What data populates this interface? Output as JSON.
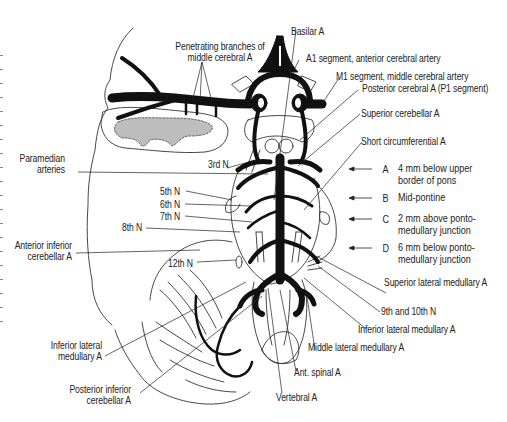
{
  "figure": {
    "colors": {
      "ink": "#111111",
      "line": "#333333",
      "gray_matter": "#bdbdbd",
      "background": "#ffffff"
    }
  },
  "labels": {
    "penetrating_branches": [
      "Penetrating branches of",
      "middle cerebral A"
    ],
    "basilar": "Basilar A",
    "a1_segment": "A1 segment, anterior cerebral artery",
    "m1_segment": "M1 segment, middle cerebral artery",
    "posterior_cerebral": "Posterior cerebral A (P1 segment)",
    "superior_cerebellar": "Superior cerebellar A",
    "short_circumferential": "Short circumferential A",
    "paramedian": [
      "Paramedian",
      "arteries"
    ],
    "third_n": "3rd N",
    "fifth_n": "5th N",
    "sixth_n": "6th N",
    "seventh_n": "7th N",
    "eighth_n": "8th N",
    "aica": [
      "Anterior inferior",
      "cerebellar A"
    ],
    "twelfth_n": "12th N",
    "superior_lateral_medullary": "Superior lateral medullary A",
    "ninth_tenth_n": "9th and 10th N",
    "inferior_lateral_medullary_right": "Inferior lateral medullary A",
    "middle_lateral_medullary": "Middle lateral medullary A",
    "ant_spinal": "Ant. spinal A",
    "vertebral": "Vertebral A",
    "inferior_lateral_medullary_left": [
      "Inferior lateral",
      "medullary A"
    ],
    "pica": [
      "Posterior inferior",
      "cerebellar A"
    ]
  },
  "section_levels": [
    {
      "letter": "A",
      "text": "4 mm below upper\nborder of pons"
    },
    {
      "letter": "B",
      "text": "Mid-pontine"
    },
    {
      "letter": "C",
      "text": "2 mm above ponto-\nmedullary junction"
    },
    {
      "letter": "D",
      "text": "6 mm below ponto-\nmedullary junction"
    }
  ]
}
